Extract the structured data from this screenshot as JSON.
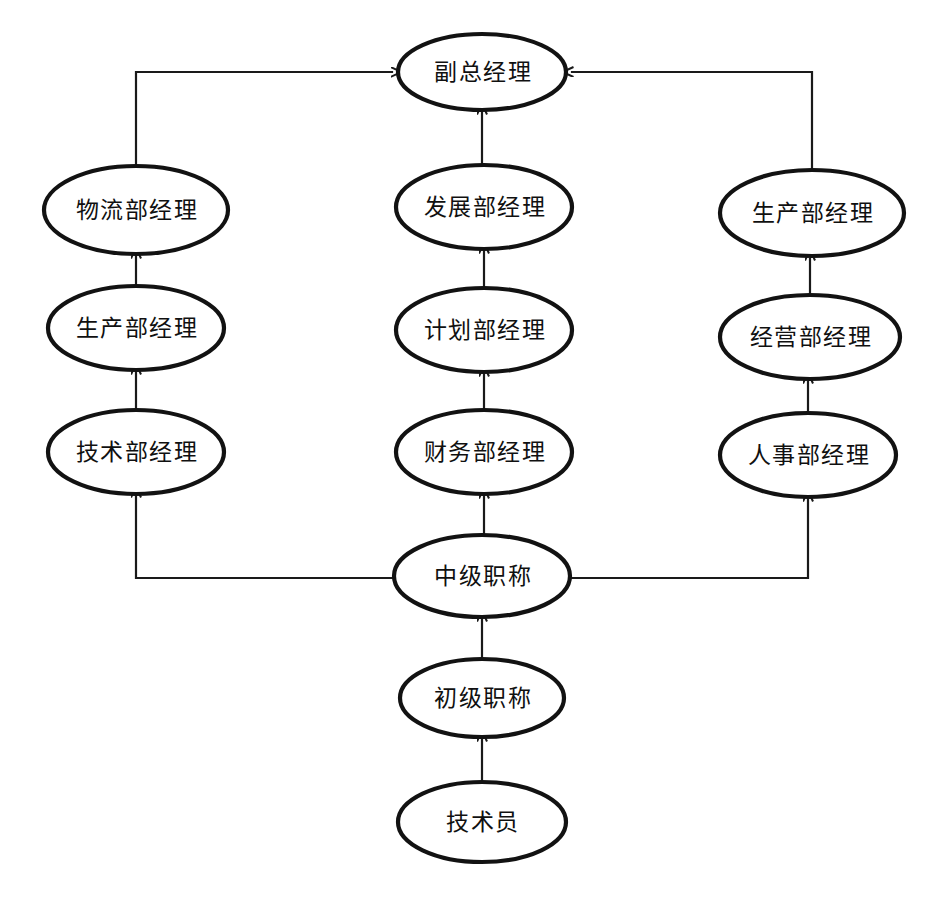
{
  "diagram": {
    "type": "hierarchy-flowchart",
    "canvas": {
      "width": 939,
      "height": 916,
      "background": "#ffffff"
    },
    "style": {
      "node_shape": "ellipse",
      "node_fill": "#ffffff",
      "node_stroke": "#121212",
      "edge_stroke": "#1a1a1a",
      "text_color": "#101010"
    },
    "nodes": [
      {
        "id": "n-vice-gm",
        "label": "副总经理",
        "cx": 482,
        "cy": 72,
        "rx": 84,
        "ry": 38
      },
      {
        "id": "n-logistics-mgr",
        "label": "物流部经理",
        "cx": 136,
        "cy": 210,
        "rx": 92,
        "ry": 44
      },
      {
        "id": "n-dev-mgr",
        "label": "发展部经理",
        "cx": 484,
        "cy": 207,
        "rx": 88,
        "ry": 42
      },
      {
        "id": "n-prod-mgr-right",
        "label": "生产部经理",
        "cx": 812,
        "cy": 213,
        "rx": 92,
        "ry": 43
      },
      {
        "id": "n-prod-mgr-left",
        "label": "生产部经理",
        "cx": 136,
        "cy": 328,
        "rx": 88,
        "ry": 42
      },
      {
        "id": "n-plan-mgr",
        "label": "计划部经理",
        "cx": 484,
        "cy": 330,
        "rx": 88,
        "ry": 42
      },
      {
        "id": "n-ops-mgr",
        "label": "经营部经理",
        "cx": 810,
        "cy": 337,
        "rx": 90,
        "ry": 42
      },
      {
        "id": "n-tech-mgr",
        "label": "技术部经理",
        "cx": 136,
        "cy": 452,
        "rx": 88,
        "ry": 42
      },
      {
        "id": "n-finance-mgr",
        "label": "财务部经理",
        "cx": 484,
        "cy": 452,
        "rx": 88,
        "ry": 42
      },
      {
        "id": "n-hr-mgr",
        "label": "人事部经理",
        "cx": 808,
        "cy": 455,
        "rx": 88,
        "ry": 42
      },
      {
        "id": "n-mid-title",
        "label": "中级职称",
        "cx": 482,
        "cy": 576,
        "rx": 88,
        "ry": 41
      },
      {
        "id": "n-junior-title",
        "label": "初级职称",
        "cx": 482,
        "cy": 698,
        "rx": 82,
        "ry": 39
      },
      {
        "id": "n-technician",
        "label": "技术员",
        "cx": 482,
        "cy": 822,
        "rx": 84,
        "ry": 40
      }
    ],
    "edges": [
      {
        "id": "e-logistics-to-vice-gm",
        "from": "n-logistics-mgr",
        "to": "n-vice-gm",
        "routing": "orthogonal-left",
        "points": "136,166 136,72 392,72",
        "arrow": "right"
      },
      {
        "id": "e-dev-to-vice-gm",
        "from": "n-dev-mgr",
        "to": "n-vice-gm",
        "routing": "vertical",
        "points": "482,165 482,113",
        "arrow": "up"
      },
      {
        "id": "e-prodright-to-vice-gm",
        "from": "n-prod-mgr-right",
        "to": "n-vice-gm",
        "routing": "orthogonal-right",
        "points": "812,170 812,72 572,72",
        "arrow": "left"
      },
      {
        "id": "e-prodleft-to-logistics",
        "from": "n-prod-mgr-left",
        "to": "n-logistics-mgr",
        "routing": "vertical",
        "points": "136,286 136,257",
        "arrow": "up"
      },
      {
        "id": "e-plan-to-dev",
        "from": "n-plan-mgr",
        "to": "n-dev-mgr",
        "routing": "vertical",
        "points": "484,288 484,252",
        "arrow": "up"
      },
      {
        "id": "e-ops-to-prodright",
        "from": "n-ops-mgr",
        "to": "n-prod-mgr-right",
        "routing": "vertical",
        "points": "810,295 810,259",
        "arrow": "up"
      },
      {
        "id": "e-tech-to-prodleft",
        "from": "n-tech-mgr",
        "to": "n-prod-mgr-left",
        "routing": "vertical",
        "points": "136,410 136,373",
        "arrow": "up"
      },
      {
        "id": "e-finance-to-plan",
        "from": "n-finance-mgr",
        "to": "n-plan-mgr",
        "routing": "vertical",
        "points": "484,410 484,375",
        "arrow": "up"
      },
      {
        "id": "e-hr-to-ops",
        "from": "n-hr-mgr",
        "to": "n-ops-mgr",
        "routing": "vertical",
        "points": "808,413 808,382",
        "arrow": "up"
      },
      {
        "id": "e-mid-to-tech",
        "from": "n-mid-title",
        "to": "n-tech-mgr",
        "routing": "orthogonal-left",
        "points": "394,578 136,578 136,496",
        "arrow": "up"
      },
      {
        "id": "e-mid-to-finance",
        "from": "n-mid-title",
        "to": "n-finance-mgr",
        "routing": "vertical",
        "points": "484,534 484,497",
        "arrow": "up"
      },
      {
        "id": "e-mid-to-hr",
        "from": "n-mid-title",
        "to": "n-hr-mgr",
        "routing": "orthogonal-right",
        "points": "570,578 808,578 808,500",
        "arrow": "up"
      },
      {
        "id": "e-junior-to-mid",
        "from": "n-junior-title",
        "to": "n-mid-title",
        "routing": "vertical",
        "points": "482,658 482,620",
        "arrow": "up"
      },
      {
        "id": "e-technician-to-junior",
        "from": "n-technician",
        "to": "n-junior-title",
        "routing": "vertical",
        "points": "482,781 482,740",
        "arrow": "up"
      }
    ]
  }
}
